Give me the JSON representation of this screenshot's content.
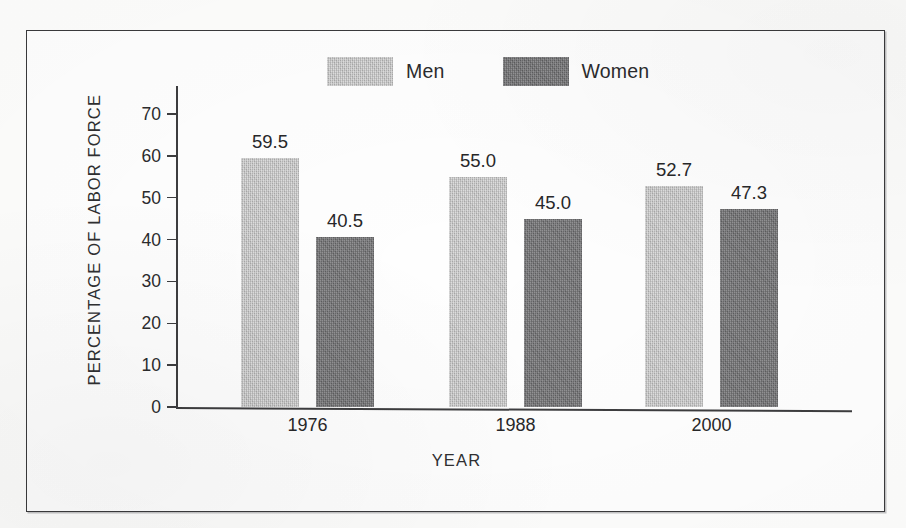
{
  "chart_data": {
    "type": "bar",
    "title": "",
    "subtitle": "",
    "xlabel": "YEAR",
    "ylabel": "PERCENTAGE OF LABOR FORCE",
    "categories": [
      "1976",
      "1988",
      "2000"
    ],
    "series": [
      {
        "name": "Men",
        "color": "#c0c0c0",
        "values": [
          59.5,
          55.0,
          52.7
        ],
        "value_labels": [
          "59.5",
          "55.0",
          "52.7"
        ]
      },
      {
        "name": "Women",
        "color": "#767678",
        "values": [
          40.5,
          45.0,
          47.3
        ],
        "value_labels": [
          "40.5",
          "45.0",
          "47.3"
        ]
      }
    ],
    "ylim": [
      0,
      70
    ],
    "yticks": [
      0,
      10,
      20,
      30,
      40,
      50,
      60,
      70
    ],
    "ytick_labels": [
      "0",
      "10",
      "20",
      "30",
      "40",
      "50",
      "60",
      "70"
    ],
    "grid": false,
    "legend_position": "top-center",
    "legend_entries": [
      "Men",
      "Women"
    ],
    "data_labels_shown": true
  },
  "legend": {
    "entries": [
      {
        "label": "Men",
        "swatch": "legend-swatch-men"
      },
      {
        "label": "Women",
        "swatch": "legend-swatch-women"
      }
    ]
  },
  "axes": {
    "y_title": "PERCENTAGE OF LABOR FORCE",
    "x_title": "YEAR"
  },
  "colors": {
    "men": "#c0c0c0",
    "women": "#767678",
    "axis": "#3d3d3f",
    "frame": "#3a3a3c",
    "text": "#272729",
    "page": "#fdfdfc"
  }
}
